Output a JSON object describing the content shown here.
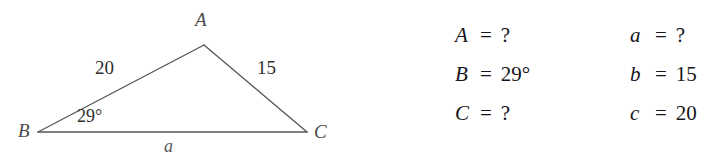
{
  "figure": {
    "vertices": {
      "A": {
        "label": "A"
      },
      "B": {
        "label": "B"
      },
      "C": {
        "label": "C"
      }
    },
    "side_labels": {
      "BA": "20",
      "AC": "15",
      "BC": "a"
    },
    "angle_labels": {
      "B": "29°"
    },
    "stroke_color": "#555555"
  },
  "equations": {
    "angles": [
      {
        "name": "A",
        "equals": "=",
        "value": "?"
      },
      {
        "name": "B",
        "equals": "=",
        "value": "29°"
      },
      {
        "name": "C",
        "equals": "=",
        "value": "?"
      }
    ],
    "sides": [
      {
        "name": "a",
        "equals": "=",
        "value": "?"
      },
      {
        "name": "b",
        "equals": "=",
        "value": "15"
      },
      {
        "name": "c",
        "equals": "=",
        "value": "20"
      }
    ]
  }
}
